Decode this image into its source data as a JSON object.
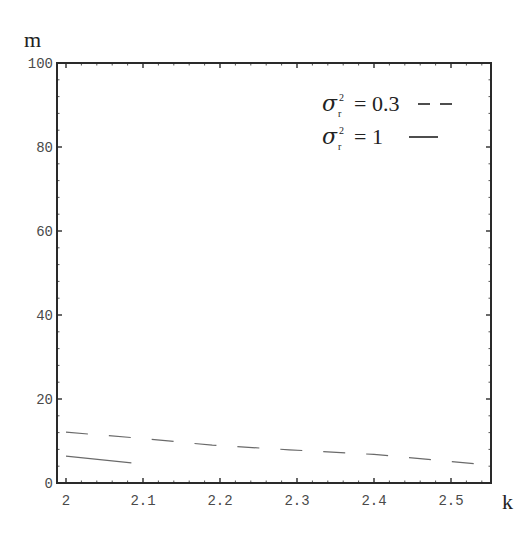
{
  "chart_data": {
    "type": "line",
    "title": "",
    "xlabel": "k",
    "ylabel": "m",
    "xlim": [
      2.0,
      2.553
    ],
    "ylim": [
      0,
      100
    ],
    "x_ticks": [
      "2",
      "2.1",
      "2.2",
      "2.3",
      "2.4",
      "2.5"
    ],
    "y_ticks": [
      "0",
      "20",
      "40",
      "60",
      "80",
      "100"
    ],
    "grid": false,
    "legend_position": "top-right (inside)",
    "legend": [
      {
        "label": "σ_r² = 0.3",
        "style": "dashed"
      },
      {
        "label": "σ_r² = 1",
        "style": "solid"
      }
    ],
    "series": [
      {
        "name": "σ_r² = 0.3",
        "style": "dashed",
        "x": [
          2.0,
          2.1,
          2.19,
          2.29,
          2.4,
          2.53
        ],
        "y": [
          12.1,
          10.6,
          9.0,
          7.9,
          6.8,
          4.6
        ]
      },
      {
        "name": "σ_r² = 1",
        "style": "solid",
        "x": [
          2.0,
          2.085
        ],
        "y": [
          6.4,
          4.8
        ]
      }
    ]
  },
  "labels": {
    "x_axis": "k",
    "y_axis": "m",
    "legend_line1_sigma": "σ",
    "legend_line1_sub": "r",
    "legend_line1_sup": "2",
    "legend_line1_value": "= 0.3",
    "legend_line1_marker": "– –",
    "legend_line2_sigma": "σ",
    "legend_line2_sub": "r",
    "legend_line2_sup": "2",
    "legend_line2_value": "= 1",
    "tick_x_0": "2",
    "tick_x_1": "2.1",
    "tick_x_2": "2.2",
    "tick_x_3": "2.3",
    "tick_x_4": "2.4",
    "tick_x_5": "2.5",
    "tick_y_0": "0",
    "tick_y_1": "20",
    "tick_y_2": "40",
    "tick_y_3": "60",
    "tick_y_4": "80",
    "tick_y_5": "100"
  },
  "colors": {
    "frame": "#2a2a2a",
    "series_dashed": "#6a6a6a",
    "series_solid": "#6a6a6a",
    "tick_text": "#4a4a4a"
  }
}
